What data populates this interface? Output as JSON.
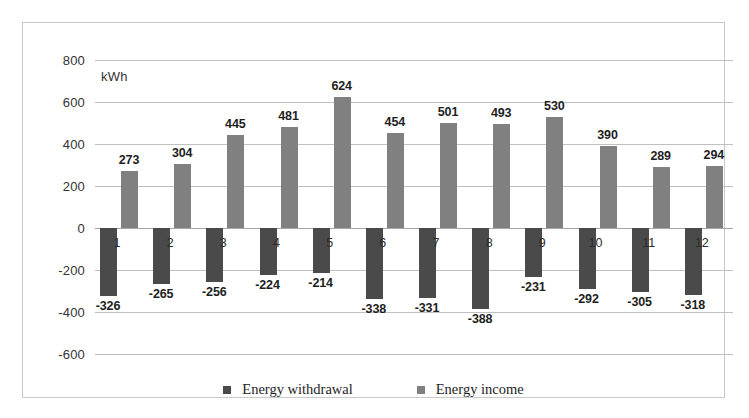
{
  "chart_data": {
    "type": "bar",
    "title": "",
    "subtitle": "",
    "unit_label": "kWh",
    "xlabel": "",
    "ylabel": "",
    "ylim": [
      -600,
      800
    ],
    "ytick_step": 200,
    "yticks": [
      "800",
      "600",
      "400",
      "200",
      "0",
      "-200",
      "-400",
      "-600"
    ],
    "grid": true,
    "legend_position": "bottom",
    "categories": [
      "1",
      "2",
      "3",
      "4",
      "5",
      "6",
      "7",
      "8",
      "9",
      "10",
      "11",
      "12"
    ],
    "series": [
      {
        "name": "Energy withdrawal",
        "color": "#4a4a4a",
        "values": [
          -326,
          -265,
          -256,
          -224,
          -214,
          -338,
          -331,
          -388,
          -231,
          -292,
          -305,
          -318
        ],
        "labels": [
          "-326",
          "-265",
          "-256",
          "-224",
          "-214",
          "-338",
          "-331",
          "-388",
          "-231",
          "-292",
          "-305",
          "-318"
        ]
      },
      {
        "name": "Energy income",
        "color": "#808080",
        "values": [
          273,
          304,
          445,
          481,
          624,
          454,
          501,
          493,
          530,
          390,
          289,
          294
        ],
        "labels": [
          "273",
          "304",
          "445",
          "481",
          "624",
          "454",
          "501",
          "493",
          "530",
          "390",
          "289",
          "294"
        ]
      }
    ]
  },
  "legend": {
    "items": [
      {
        "label": "Energy withdrawal",
        "color": "#4a4a4a"
      },
      {
        "label": "Energy income",
        "color": "#808080"
      }
    ]
  },
  "colors": {
    "withdrawal": "#4a4a4a",
    "income": "#808080",
    "gridline": "#c0c0c0",
    "border": "#c9c9c9",
    "text": "#1e1e1e"
  }
}
